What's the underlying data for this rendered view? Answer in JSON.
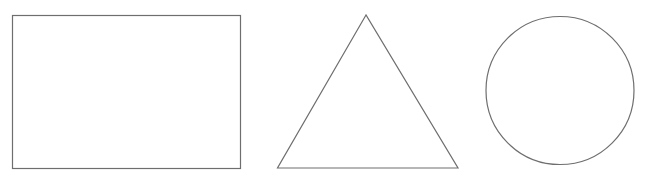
{
  "canvas": {
    "width": 659,
    "height": 179,
    "background": "#ffffff"
  },
  "style": {
    "stroke_color": "#6e6e6e",
    "fill_color": "none"
  },
  "shapes": [
    {
      "type": "rectangle",
      "label": "rectangle",
      "x": 12.5,
      "y": 15.5,
      "width": 228,
      "height": 153
    },
    {
      "type": "triangle",
      "label": "triangle",
      "points": [
        [
          366,
          15
        ],
        [
          277.5,
          168
        ],
        [
          458,
          168
        ]
      ]
    },
    {
      "type": "circle",
      "label": "circle",
      "cx": 560,
      "cy": 90.5,
      "r": 74
    }
  ]
}
